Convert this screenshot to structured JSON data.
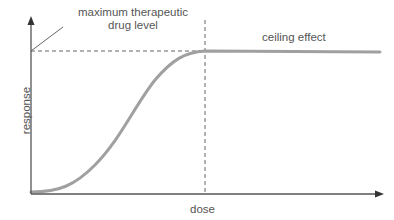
{
  "diagram": {
    "labels": {
      "max_line1": "maximum therapeutic",
      "max_line2": "drug level",
      "ceiling": "ceiling effect",
      "x_axis": "dose",
      "y_axis": "response"
    },
    "colors": {
      "axis": "#555555",
      "curve": "#a0a0a0",
      "dashed": "#666666",
      "text": "#555555"
    }
  }
}
